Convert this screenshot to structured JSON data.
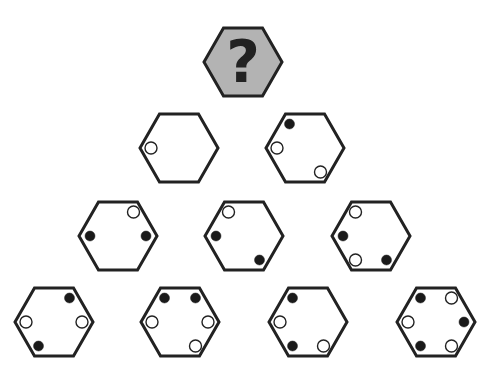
{
  "puzzle": {
    "question_tile": {
      "label": "?",
      "center": [
        243,
        62
      ],
      "fill": "#b3b3b3",
      "text_color": "#222222"
    },
    "colors": {
      "stroke": "#222222",
      "black_dot": "#1a1a1a",
      "white_dot": "#ffffff",
      "background": "#ffffff"
    },
    "hex_size": {
      "rx": 39,
      "ry": 34
    },
    "position_legend": [
      "TL",
      "TR",
      "R",
      "BR",
      "BL",
      "L"
    ],
    "rows": [
      {
        "row": 1,
        "tiles": [
          {
            "id": "r1-1",
            "center": [
              179,
              148
            ],
            "dots": [
              {
                "pos": "L",
                "color": "white"
              }
            ]
          },
          {
            "id": "r1-2",
            "center": [
              305,
              148
            ],
            "dots": [
              {
                "pos": "TL",
                "color": "black"
              },
              {
                "pos": "L",
                "color": "white"
              },
              {
                "pos": "BR",
                "color": "white"
              }
            ]
          }
        ]
      },
      {
        "row": 2,
        "tiles": [
          {
            "id": "r2-1",
            "center": [
              118,
              236
            ],
            "dots": [
              {
                "pos": "TR",
                "color": "white"
              },
              {
                "pos": "L",
                "color": "black"
              },
              {
                "pos": "R",
                "color": "black"
              }
            ]
          },
          {
            "id": "r2-2",
            "center": [
              244,
              236
            ],
            "dots": [
              {
                "pos": "TL",
                "color": "white"
              },
              {
                "pos": "L",
                "color": "black"
              },
              {
                "pos": "BR",
                "color": "black"
              }
            ]
          },
          {
            "id": "r2-3",
            "center": [
              371,
              236
            ],
            "dots": [
              {
                "pos": "TL",
                "color": "white"
              },
              {
                "pos": "L",
                "color": "black"
              },
              {
                "pos": "BL",
                "color": "white"
              },
              {
                "pos": "BR",
                "color": "black"
              }
            ]
          }
        ]
      },
      {
        "row": 3,
        "tiles": [
          {
            "id": "r3-1",
            "center": [
              54,
              322
            ],
            "dots": [
              {
                "pos": "TR",
                "color": "black"
              },
              {
                "pos": "L",
                "color": "white"
              },
              {
                "pos": "R",
                "color": "white"
              },
              {
                "pos": "BL",
                "color": "black"
              }
            ]
          },
          {
            "id": "r3-2",
            "center": [
              180,
              322
            ],
            "dots": [
              {
                "pos": "TL",
                "color": "black"
              },
              {
                "pos": "TR",
                "color": "black"
              },
              {
                "pos": "L",
                "color": "white"
              },
              {
                "pos": "R",
                "color": "white"
              },
              {
                "pos": "BR",
                "color": "white"
              }
            ]
          },
          {
            "id": "r3-3",
            "center": [
              308,
              322
            ],
            "dots": [
              {
                "pos": "TL",
                "color": "black"
              },
              {
                "pos": "L",
                "color": "white"
              },
              {
                "pos": "BL",
                "color": "black"
              },
              {
                "pos": "BR",
                "color": "white"
              }
            ]
          },
          {
            "id": "r3-4",
            "center": [
              436,
              322
            ],
            "dots": [
              {
                "pos": "TL",
                "color": "black"
              },
              {
                "pos": "TR",
                "color": "white"
              },
              {
                "pos": "L",
                "color": "white"
              },
              {
                "pos": "R",
                "color": "black"
              },
              {
                "pos": "BL",
                "color": "black"
              },
              {
                "pos": "BR",
                "color": "white"
              }
            ]
          }
        ]
      }
    ]
  }
}
